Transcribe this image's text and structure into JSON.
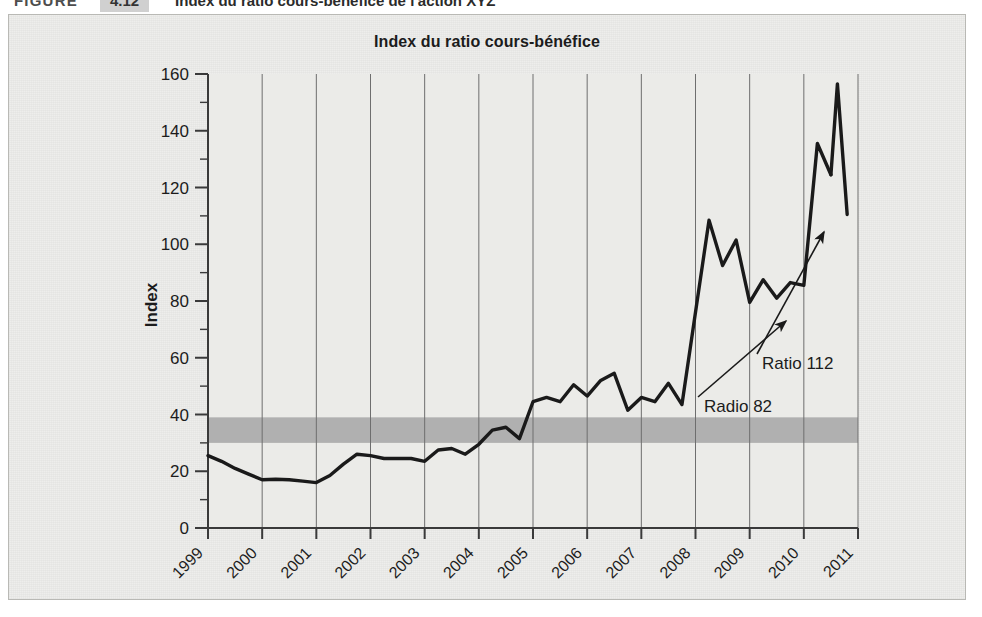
{
  "figure_caption": {
    "label": "FIGURE",
    "number": "4.12",
    "title": "Index du ratio cours-bénéfice de l'action XYZ"
  },
  "chart_data": {
    "type": "line",
    "title": "Index du ratio cours-bénéfice",
    "xlabel": "",
    "ylabel": "Index",
    "ylim": [
      0,
      160
    ],
    "yticks": [
      0,
      20,
      40,
      60,
      80,
      100,
      120,
      140,
      160
    ],
    "xlim": [
      1999,
      2011
    ],
    "xticks": [
      "1999",
      "2000",
      "2001",
      "2002",
      "2003",
      "2004",
      "2005",
      "2006",
      "2007",
      "2008",
      "2009",
      "2010",
      "2011"
    ],
    "grid": "vertical",
    "legend": "none",
    "accent_color": "#1a1a1a",
    "band_color": "#a6a6a6",
    "plot_bg": "#ebebe8",
    "shaded_band": {
      "label": "bande de référence",
      "y_min": 30,
      "y_max": 39
    },
    "series": [
      {
        "name": "Index du ratio cours-bénéfice",
        "x": [
          1999.0,
          1999.25,
          1999.5,
          1999.75,
          2000.0,
          2000.25,
          2000.5,
          2000.75,
          2001.0,
          2001.25,
          2001.5,
          2001.75,
          2002.0,
          2002.25,
          2002.5,
          2002.75,
          2003.0,
          2003.25,
          2003.5,
          2003.75,
          2004.0,
          2004.25,
          2004.5,
          2004.75,
          2005.0,
          2005.25,
          2005.5,
          2005.75,
          2006.0,
          2006.25,
          2006.5,
          2006.75,
          2007.0,
          2007.25,
          2007.5,
          2007.75,
          2008.0,
          2008.25,
          2008.5,
          2008.75,
          2009.0,
          2009.25,
          2009.5,
          2009.75,
          2010.0,
          2010.25,
          2010.5
        ],
        "y": [
          25.5,
          23.5,
          21.0,
          19.0,
          17.0,
          17.2,
          17.0,
          16.5,
          16.0,
          18.5,
          22.5,
          26.0,
          25.5,
          24.5,
          24.5,
          24.5,
          23.5,
          27.5,
          28.0,
          26.0,
          29.5,
          34.5,
          35.5,
          31.5,
          44.5,
          46.0,
          44.5,
          50.5,
          46.5,
          52.0,
          54.5,
          41.5,
          46.0,
          44.5,
          51.0,
          43.5,
          76.0,
          108.5,
          92.5,
          101.5,
          79.5,
          87.5,
          81.0,
          86.5,
          85.5,
          135.5,
          124.5
        ]
      },
      {
        "name": "pic final",
        "x": [
          2010.5,
          2010.62,
          2010.8
        ],
        "y": [
          124.5,
          156.5,
          110.5
        ]
      }
    ],
    "annotations": [
      {
        "text": "Radio 82",
        "value": 82,
        "text_x": 695,
        "text_y": 397,
        "arrow_from_x": 689,
        "arrow_from_y": 382,
        "arrow_to_x": 777,
        "arrow_to_y": 306
      },
      {
        "text": "Ratio 112",
        "value": 112,
        "text_x": 753,
        "text_y": 354,
        "arrow_from_x": 748,
        "arrow_from_y": 339,
        "arrow_to_x": 815,
        "arrow_to_y": 217
      }
    ]
  }
}
